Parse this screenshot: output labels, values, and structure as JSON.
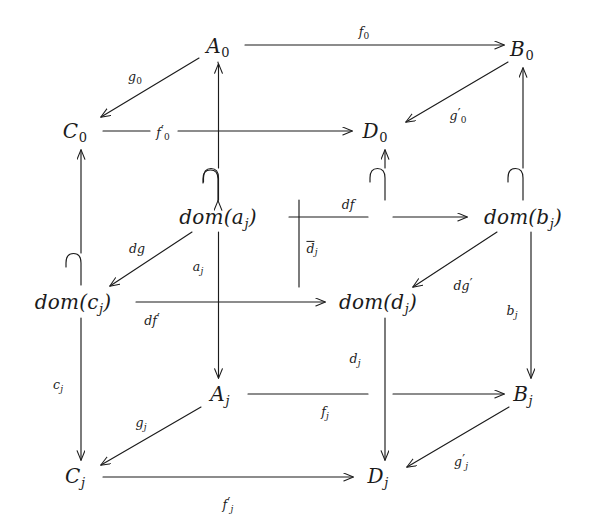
{
  "diagram": {
    "type": "commutative-diagram",
    "width": 593,
    "height": 532,
    "background_color": "#ffffff",
    "stroke_color": "#1b1b1b"
  },
  "nodes": [
    {
      "id": "A0",
      "base": "A",
      "sub": "0",
      "sub_style": "digit",
      "x": 218,
      "y": 47,
      "label": "A₀"
    },
    {
      "id": "B0",
      "base": "B",
      "sub": "0",
      "sub_style": "digit",
      "x": 522,
      "y": 50,
      "label": "B₀"
    },
    {
      "id": "C0",
      "base": "C",
      "sub": "0",
      "sub_style": "digit",
      "x": 75,
      "y": 132,
      "label": "C₀"
    },
    {
      "id": "D0",
      "base": "D",
      "sub": "0",
      "sub_style": "digit",
      "x": 375,
      "y": 132,
      "label": "D₀"
    },
    {
      "id": "domaj",
      "base": "dom(a",
      "sub": "j",
      "sub_style": "italic",
      "tail": ")",
      "x": 218,
      "y": 218,
      "label": "dom(aⱼ)"
    },
    {
      "id": "dombj",
      "base": "dom(b",
      "sub": "j",
      "sub_style": "italic",
      "tail": ")",
      "x": 523,
      "y": 218,
      "label": "dom(bⱼ)"
    },
    {
      "id": "domcj",
      "base": "dom(c",
      "sub": "j",
      "sub_style": "italic",
      "tail": ")",
      "x": 73,
      "y": 303,
      "label": "dom(cⱼ)"
    },
    {
      "id": "domdj",
      "base": "dom(d",
      "sub": "j",
      "sub_style": "italic",
      "tail": ")",
      "x": 378,
      "y": 303,
      "label": "dom(dⱼ)"
    },
    {
      "id": "Aj",
      "base": "A",
      "sub": "j",
      "sub_style": "italic",
      "x": 220,
      "y": 395,
      "label": "Aⱼ"
    },
    {
      "id": "Bj",
      "base": "B",
      "sub": "j",
      "sub_style": "italic",
      "x": 523,
      "y": 395,
      "label": "Bⱼ"
    },
    {
      "id": "Cj",
      "base": "C",
      "sub": "j",
      "sub_style": "italic",
      "x": 75,
      "y": 477,
      "label": "Cⱼ"
    },
    {
      "id": "Dj",
      "base": "D",
      "sub": "j",
      "sub_style": "italic",
      "x": 378,
      "y": 477,
      "label": "Dⱼ"
    }
  ],
  "edges": [
    {
      "id": "f0",
      "from": "A0",
      "to": "B0",
      "kind": "arrow",
      "label": "f₀",
      "base": "f",
      "sub": "0",
      "sub_style": "digit",
      "prime": false,
      "overline": false,
      "label_x": 364,
      "label_y": 33
    },
    {
      "id": "f0p",
      "from": "C0",
      "to": "D0",
      "kind": "arrow",
      "label": "f'₀",
      "base": "f",
      "sub": "0",
      "sub_style": "digit",
      "prime": true,
      "overline": false,
      "label_x": 163,
      "label_y": 133
    },
    {
      "id": "g0",
      "from": "A0",
      "to": "C0",
      "kind": "arrow",
      "label": "g₀",
      "base": "g",
      "sub": "0",
      "sub_style": "digit",
      "prime": false,
      "overline": false,
      "label_x": 135,
      "label_y": 78
    },
    {
      "id": "g0p",
      "from": "B0",
      "to": "D0",
      "kind": "arrow",
      "label": "g'₀",
      "base": "g",
      "sub": "0",
      "sub_style": "digit",
      "prime": true,
      "overline": false,
      "label_x": 458,
      "label_y": 116
    },
    {
      "id": "df",
      "from": "domaj",
      "to": "dombj",
      "kind": "arrow",
      "label": "df",
      "base": "df",
      "sub": "",
      "sub_style": "none",
      "prime": false,
      "overline": false,
      "label_x": 348,
      "label_y": 205
    },
    {
      "id": "dfp",
      "from": "domcj",
      "to": "domdj",
      "kind": "arrow",
      "label": "df'",
      "base": "df",
      "sub": "",
      "sub_style": "none",
      "prime": true,
      "overline": false,
      "label_x": 152,
      "label_y": 320
    },
    {
      "id": "dg",
      "from": "domaj",
      "to": "domcj",
      "kind": "arrow",
      "label": "dg",
      "base": "dg",
      "sub": "",
      "sub_style": "none",
      "prime": false,
      "overline": false,
      "label_x": 137,
      "label_y": 249
    },
    {
      "id": "dgp",
      "from": "dombj",
      "to": "domdj",
      "kind": "arrow",
      "label": "dg'",
      "base": "dg",
      "sub": "",
      "sub_style": "none",
      "prime": true,
      "overline": false,
      "label_x": 463,
      "label_y": 285
    },
    {
      "id": "fj",
      "from": "Aj",
      "to": "Bj",
      "kind": "arrow",
      "label": "fⱼ",
      "base": "f",
      "sub": "j",
      "sub_style": "italic",
      "prime": false,
      "overline": false,
      "label_x": 325,
      "label_y": 413
    },
    {
      "id": "fjp",
      "from": "Cj",
      "to": "Dj",
      "kind": "arrow",
      "label": "f'ⱼ",
      "base": "f",
      "sub": "j",
      "sub_style": "italic",
      "prime": true,
      "overline": false,
      "label_x": 228,
      "label_y": 505
    },
    {
      "id": "gj",
      "from": "Aj",
      "to": "Cj",
      "kind": "arrow",
      "label": "gⱼ",
      "base": "g",
      "sub": "j",
      "sub_style": "italic",
      "prime": false,
      "overline": false,
      "label_x": 141,
      "label_y": 424
    },
    {
      "id": "gjp",
      "from": "Bj",
      "to": "Dj",
      "kind": "arrow",
      "label": "g'ⱼ",
      "base": "g",
      "sub": "j",
      "sub_style": "italic",
      "prime": true,
      "overline": false,
      "label_x": 461,
      "label_y": 462
    },
    {
      "id": "mono_a",
      "from": "domaj",
      "to": "A0",
      "kind": "hook-up",
      "label": "",
      "base": "",
      "sub": "",
      "sub_style": "none",
      "prime": false,
      "overline": false,
      "label_x": 0,
      "label_y": 0
    },
    {
      "id": "mono_b",
      "from": "dombj",
      "to": "B0",
      "kind": "hook-up",
      "label": "",
      "base": "",
      "sub": "",
      "sub_style": "none",
      "prime": false,
      "overline": false,
      "label_x": 0,
      "label_y": 0
    },
    {
      "id": "mono_c",
      "from": "domcj",
      "to": "C0",
      "kind": "hook-up",
      "label": "",
      "base": "",
      "sub": "",
      "sub_style": "none",
      "prime": false,
      "overline": false,
      "label_x": 0,
      "label_y": 0
    },
    {
      "id": "mono_d",
      "from": "domdj",
      "to": "D0",
      "kind": "hook-up",
      "label": "",
      "base": "",
      "sub": "",
      "sub_style": "none",
      "prime": false,
      "overline": false,
      "label_x": 0,
      "label_y": 0
    },
    {
      "id": "aj",
      "from": "domaj",
      "to": "Aj",
      "kind": "arrow-down",
      "label": "aⱼ",
      "base": "a",
      "sub": "j",
      "sub_style": "italic",
      "prime": false,
      "overline": false,
      "label_x": 198,
      "label_y": 268
    },
    {
      "id": "bj",
      "from": "dombj",
      "to": "Bj",
      "kind": "arrow-down",
      "label": "bⱼ",
      "base": "b",
      "sub": "j",
      "sub_style": "italic",
      "prime": false,
      "overline": false,
      "label_x": 512,
      "label_y": 312
    },
    {
      "id": "cj",
      "from": "domcj",
      "to": "Cj",
      "kind": "arrow-down",
      "label": "cⱼ",
      "base": "c",
      "sub": "j",
      "sub_style": "italic",
      "prime": false,
      "overline": false,
      "label_x": 58,
      "label_y": 386
    },
    {
      "id": "dj",
      "from": "domdj",
      "to": "Dj",
      "kind": "arrow-down",
      "label": "dⱼ",
      "base": "d",
      "sub": "j",
      "sub_style": "italic",
      "prime": false,
      "overline": false,
      "label_x": 355,
      "label_y": 360
    },
    {
      "id": "dbarj",
      "from": "dombj_mid",
      "to": "domdj_mid",
      "kind": "vline",
      "label": "d̄ⱼ",
      "base": "d",
      "sub": "j",
      "sub_style": "italic",
      "prime": false,
      "overline": true,
      "label_x": 312,
      "label_y": 249
    }
  ]
}
